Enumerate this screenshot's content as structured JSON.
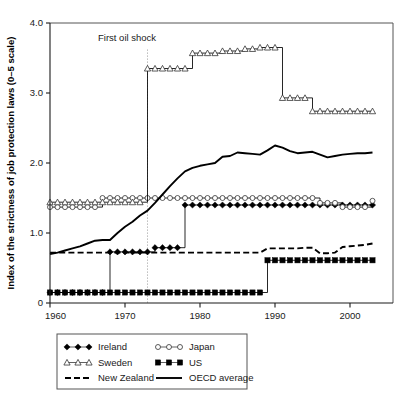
{
  "figure": {
    "background_color": "#ffffff",
    "plot_frame_color": "#555555",
    "ink_color": "#000000"
  },
  "chart_data": {
    "type": "line",
    "title": "",
    "subtitle": "",
    "xlabel": "",
    "ylabel": "Index of the strictness of job protection laws (0–5 scale)",
    "xlim": [
      1960,
      2004
    ],
    "ylim": [
      0,
      4.0
    ],
    "grid": false,
    "legend_position": "below-plot",
    "y_ticks": [
      "0",
      "1.0",
      "2.0",
      "3.0",
      "4.0"
    ],
    "y_tick_values": [
      0,
      1.0,
      2.0,
      3.0,
      4.0
    ],
    "x_ticks": [
      "1960",
      "1970",
      "1980",
      "1990",
      "2000"
    ],
    "x_tick_values": [
      1960,
      1970,
      1980,
      1990,
      2000
    ],
    "annotations": [
      {
        "text": "First oil shock",
        "x": 1973,
        "label_x": 1966.4,
        "label_y": 3.74,
        "marker": "dotted-vertical-line",
        "line_top": 3.62,
        "line_bottom": 0.0
      }
    ],
    "series": [
      {
        "name": "Ireland",
        "style": "line-markers",
        "marker": "filled-diamond",
        "x": [
          1960,
          1961,
          1962,
          1963,
          1964,
          1965,
          1966,
          1967,
          1968,
          1969,
          1970,
          1971,
          1972,
          1973,
          1974,
          1975,
          1976,
          1977,
          1978,
          1979,
          1980,
          1981,
          1982,
          1983,
          1984,
          1985,
          1986,
          1987,
          1988,
          1989,
          1990,
          1991,
          1992,
          1993,
          1994,
          1995,
          1996,
          1997,
          1998,
          1999,
          2000,
          2001,
          2002,
          2003
        ],
        "values": [
          0.15,
          0.15,
          0.15,
          0.15,
          0.15,
          0.15,
          0.15,
          0.15,
          0.73,
          0.73,
          0.73,
          0.73,
          0.73,
          0.73,
          0.79,
          0.79,
          0.79,
          0.79,
          1.4,
          1.4,
          1.4,
          1.4,
          1.4,
          1.4,
          1.4,
          1.4,
          1.4,
          1.4,
          1.4,
          1.4,
          1.4,
          1.4,
          1.4,
          1.4,
          1.4,
          1.4,
          1.4,
          1.4,
          1.4,
          1.4,
          1.4,
          1.4,
          1.4,
          1.4
        ]
      },
      {
        "name": "Japan",
        "style": "line-markers",
        "marker": "open-circle",
        "x": [
          1960,
          1961,
          1962,
          1963,
          1964,
          1965,
          1966,
          1967,
          1968,
          1969,
          1970,
          1971,
          1972,
          1973,
          1974,
          1975,
          1976,
          1977,
          1978,
          1979,
          1980,
          1981,
          1982,
          1983,
          1984,
          1985,
          1986,
          1987,
          1988,
          1989,
          1990,
          1991,
          1992,
          1993,
          1994,
          1995,
          1996,
          1997,
          1998,
          1999,
          2000,
          2001,
          2002,
          2003
        ],
        "values": [
          1.37,
          1.37,
          1.37,
          1.37,
          1.37,
          1.37,
          1.37,
          1.5,
          1.5,
          1.5,
          1.5,
          1.5,
          1.5,
          1.5,
          1.5,
          1.5,
          1.5,
          1.5,
          1.5,
          1.5,
          1.5,
          1.5,
          1.5,
          1.5,
          1.5,
          1.5,
          1.5,
          1.5,
          1.5,
          1.5,
          1.5,
          1.5,
          1.5,
          1.5,
          1.5,
          1.5,
          1.43,
          1.43,
          1.43,
          1.37,
          1.37,
          1.37,
          1.37,
          1.46
        ]
      },
      {
        "name": "Sweden",
        "style": "line-markers",
        "marker": "open-triangle",
        "x": [
          1960,
          1961,
          1962,
          1963,
          1964,
          1965,
          1966,
          1967,
          1968,
          1969,
          1970,
          1971,
          1972,
          1973,
          1974,
          1975,
          1976,
          1977,
          1978,
          1979,
          1980,
          1981,
          1982,
          1983,
          1984,
          1985,
          1986,
          1987,
          1988,
          1989,
          1990,
          1991,
          1992,
          1993,
          1994,
          1995,
          1996,
          1997,
          1998,
          1999,
          2000,
          2001,
          2002,
          2003
        ],
        "values": [
          1.44,
          1.44,
          1.44,
          1.44,
          1.44,
          1.44,
          1.44,
          1.44,
          1.44,
          1.44,
          1.44,
          1.44,
          1.44,
          3.35,
          3.35,
          3.35,
          3.35,
          3.35,
          3.35,
          3.57,
          3.57,
          3.57,
          3.57,
          3.6,
          3.6,
          3.6,
          3.63,
          3.63,
          3.65,
          3.65,
          3.65,
          2.93,
          2.93,
          2.93,
          2.93,
          2.74,
          2.74,
          2.74,
          2.74,
          2.74,
          2.74,
          2.74,
          2.74,
          2.74
        ]
      },
      {
        "name": "US",
        "style": "line-markers",
        "marker": "filled-square",
        "x": [
          1960,
          1961,
          1962,
          1963,
          1964,
          1965,
          1966,
          1967,
          1968,
          1969,
          1970,
          1971,
          1972,
          1973,
          1974,
          1975,
          1976,
          1977,
          1978,
          1979,
          1980,
          1981,
          1982,
          1983,
          1984,
          1985,
          1986,
          1987,
          1988,
          1989,
          1990,
          1991,
          1992,
          1993,
          1994,
          1995,
          1996,
          1997,
          1998,
          1999,
          2000,
          2001,
          2002,
          2003
        ],
        "values": [
          0.15,
          0.15,
          0.15,
          0.15,
          0.15,
          0.15,
          0.15,
          0.15,
          0.15,
          0.15,
          0.15,
          0.15,
          0.15,
          0.15,
          0.15,
          0.15,
          0.15,
          0.15,
          0.15,
          0.15,
          0.15,
          0.15,
          0.15,
          0.15,
          0.15,
          0.15,
          0.15,
          0.15,
          0.15,
          0.61,
          0.61,
          0.61,
          0.61,
          0.61,
          0.61,
          0.61,
          0.61,
          0.61,
          0.61,
          0.61,
          0.61,
          0.61,
          0.61,
          0.61
        ]
      },
      {
        "name": "New Zealand",
        "style": "dashed",
        "marker": "none",
        "x": [
          1960,
          1965,
          1970,
          1973,
          1977,
          1978,
          1982,
          1986,
          1988,
          1989,
          1993,
          1994,
          1995,
          1996,
          1997,
          1998,
          1999,
          2000,
          2001,
          2002,
          2003
        ],
        "values": [
          0.72,
          0.72,
          0.72,
          0.72,
          0.72,
          0.72,
          0.72,
          0.72,
          0.72,
          0.78,
          0.78,
          0.79,
          0.79,
          0.71,
          0.71,
          0.72,
          0.8,
          0.81,
          0.82,
          0.83,
          0.85
        ]
      },
      {
        "name": "OECD average",
        "style": "solid",
        "marker": "none",
        "x": [
          1960,
          1961,
          1962,
          1963,
          1964,
          1965,
          1966,
          1967,
          1968,
          1969,
          1970,
          1971,
          1972,
          1973,
          1974,
          1975,
          1976,
          1977,
          1978,
          1979,
          1980,
          1981,
          1982,
          1983,
          1984,
          1985,
          1986,
          1987,
          1988,
          1989,
          1990,
          1991,
          1992,
          1993,
          1994,
          1995,
          1996,
          1997,
          1998,
          1999,
          2000,
          2001,
          2002,
          2003
        ],
        "values": [
          0.7,
          0.72,
          0.75,
          0.78,
          0.81,
          0.85,
          0.89,
          0.9,
          0.9,
          1.0,
          1.09,
          1.16,
          1.25,
          1.32,
          1.43,
          1.55,
          1.67,
          1.78,
          1.88,
          1.93,
          1.96,
          1.98,
          2.0,
          2.09,
          2.1,
          2.15,
          2.14,
          2.13,
          2.12,
          2.18,
          2.25,
          2.22,
          2.17,
          2.14,
          2.15,
          2.16,
          2.12,
          2.08,
          2.1,
          2.12,
          2.13,
          2.14,
          2.14,
          2.15
        ]
      }
    ]
  },
  "legend": {
    "entries": [
      {
        "label": "Ireland",
        "marker": "filled-diamond",
        "style": "line-markers"
      },
      {
        "label": "Japan",
        "marker": "open-circle",
        "style": "line-markers"
      },
      {
        "label": "Sweden",
        "marker": "open-triangle",
        "style": "line-markers"
      },
      {
        "label": "US",
        "marker": "filled-square",
        "style": "line-markers"
      },
      {
        "label": "New Zealand",
        "marker": "none",
        "style": "dashed"
      },
      {
        "label": "OECD average",
        "marker": "none",
        "style": "solid"
      }
    ]
  }
}
